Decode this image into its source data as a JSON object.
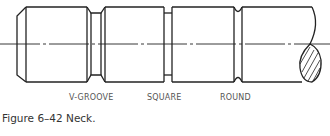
{
  "figure": {
    "caption": "Figure 6–42 Neck.",
    "labels": [
      {
        "text": "V-GROOVE",
        "x": 69
      },
      {
        "text": "SQUARE",
        "x": 147
      },
      {
        "text": "ROUND",
        "x": 220
      }
    ],
    "line_color": "#222222",
    "label_color": "#555555"
  }
}
